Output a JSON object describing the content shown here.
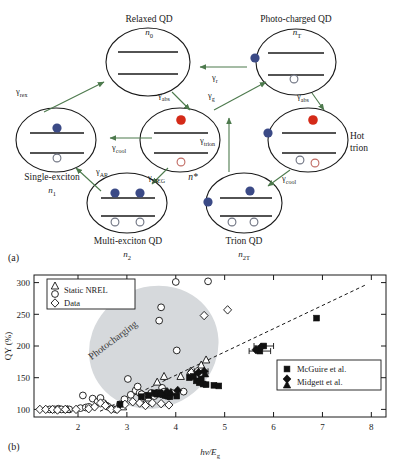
{
  "figure": {
    "panel_a": {
      "tag": "(a)",
      "title_note": "Quantum dot multiexciton / photocharging state diagram",
      "states": [
        {
          "id": "relaxed",
          "name": "Relaxed QD",
          "symbol": "n",
          "sub": "0",
          "cx": 148,
          "cy": 62,
          "rx": 42,
          "ry": 34
        },
        {
          "id": "photocharged",
          "name": "Photo-charged QD",
          "symbol": "n",
          "sub": "T",
          "cx": 296,
          "cy": 62,
          "rx": 40,
          "ry": 33
        },
        {
          "id": "single",
          "name": "Single-exciton",
          "symbol": "n",
          "sub": "1",
          "cx": 56,
          "cy": 140,
          "rx": 40,
          "ry": 32
        },
        {
          "id": "nstar",
          "name": "",
          "symbol": "n",
          "sub": "*",
          "cx": 180,
          "cy": 140,
          "rx": 40,
          "ry": 32
        },
        {
          "id": "hottrion",
          "name": "Hot trion",
          "symbol": "",
          "sub": "",
          "cx": 308,
          "cy": 140,
          "rx": 40,
          "ry": 32
        },
        {
          "id": "multi",
          "name": "Multi-exciton QD",
          "symbol": "n",
          "sub": "2",
          "cx": 127,
          "cy": 203,
          "rx": 40,
          "ry": 30
        },
        {
          "id": "trion",
          "name": "Trion QD",
          "symbol": "n",
          "sub": "2T",
          "cx": 244,
          "cy": 203,
          "rx": 38,
          "ry": 30
        }
      ],
      "state_labels": [
        {
          "key": "relaxed-title",
          "text": "Relaxed QD"
        },
        {
          "key": "relaxed-n",
          "text": "n"
        },
        {
          "key": "photocharged-title",
          "text": "Photo-charged QD"
        },
        {
          "key": "photocharged-n",
          "text": "n"
        },
        {
          "key": "single-title",
          "text": "Single-exciton"
        },
        {
          "key": "single-n",
          "text": "n"
        },
        {
          "key": "nstar-n",
          "text": "n*"
        },
        {
          "key": "hottrion-title-1",
          "text": "Hot"
        },
        {
          "key": "hottrion-title-2",
          "text": "trion"
        },
        {
          "key": "multi-title",
          "text": "Multi-exciton QD"
        },
        {
          "key": "multi-n",
          "text": "n"
        },
        {
          "key": "trion-title",
          "text": "Trion QD"
        },
        {
          "key": "trion-n",
          "text": "n"
        }
      ],
      "subscripts": {
        "relaxed": "0",
        "photocharged": "T",
        "single": "1",
        "multi": "2",
        "trion": "2T"
      },
      "rates": [
        {
          "id": "rex",
          "gamma": "γ",
          "sub": "rex",
          "x": 18,
          "y": 92
        },
        {
          "id": "abs1",
          "gamma": "γ",
          "sub": "abs",
          "x": 160,
          "y": 96
        },
        {
          "id": "r",
          "gamma": "γ",
          "sub": "r",
          "x": 196,
          "y": 79
        },
        {
          "id": "g",
          "gamma": "γ",
          "sub": "g",
          "x": 213,
          "y": 93
        },
        {
          "id": "abs2",
          "gamma": "γ",
          "sub": "abs",
          "x": 300,
          "y": 96
        },
        {
          "id": "cool1",
          "gamma": "γ",
          "sub": "cool",
          "x": 116,
          "y": 146
        },
        {
          "id": "trion",
          "gamma": "γ",
          "sub": "trion",
          "x": 212,
          "y": 140
        },
        {
          "id": "ar",
          "gamma": "γ",
          "sub": "AR",
          "x": 98,
          "y": 171
        },
        {
          "id": "meg",
          "gamma": "γ",
          "sub": "MEG",
          "x": 152,
          "y": 176
        },
        {
          "id": "cool2",
          "gamma": "γ",
          "sub": "cool",
          "x": 287,
          "y": 176
        }
      ],
      "colors": {
        "electron": "#3b4a86",
        "hot_electron": "#d42a18",
        "hole_outline": "#6d7280",
        "hot_hole_outline": "#c06a62",
        "arrow": "#4d7a4d",
        "qd_outline": "#1a1a1a"
      }
    },
    "panel_b": {
      "tag": "(b)"
    }
  },
  "chart_data": {
    "type": "scatter",
    "title": "",
    "xlabel": "hν/E",
    "xlabel_sub": "g",
    "ylabel": "QY (%)",
    "xlim": [
      1.1,
      8.3
    ],
    "ylim": [
      88,
      312
    ],
    "xticks": [
      2,
      3,
      4,
      5,
      6,
      7,
      8
    ],
    "yticks": [
      100,
      150,
      200,
      250,
      300
    ],
    "grid": false,
    "annotations": [
      {
        "text": "Photocharging",
        "x": 2.75,
        "y": 205,
        "rotation": -37
      }
    ],
    "shaded_region": {
      "label": "Photocharging",
      "type": "ellipse",
      "cx": 3.55,
      "cy": 198,
      "rx": 1.35,
      "ry": 95,
      "rotation": -28,
      "color": "#d6d9dc"
    },
    "trendline": {
      "type": "dashed",
      "x": [
        2.45,
        7.9
      ],
      "y": [
        97,
        297
      ]
    },
    "legends": [
      {
        "id": "left-legend",
        "position": "top-left",
        "entries": [
          {
            "marker": "triangle-open",
            "label": "Static NREL"
          },
          {
            "marker": "circle-open",
            "label": "Static NREL"
          },
          {
            "marker": "diamond-open",
            "label": "Data"
          }
        ],
        "lines": [
          "Static NREL",
          "Data"
        ]
      },
      {
        "id": "right-legend",
        "position": "mid-right",
        "entries": [
          {
            "marker": "square-filled",
            "label": "McGuire et al."
          },
          {
            "marker": "diamond-filled",
            "label": "Midgett et al."
          },
          {
            "marker": "triangle-filled",
            "label": "Midgett et al."
          }
        ],
        "lines": [
          "McGuire et al.",
          "Midgett et al."
        ]
      }
    ],
    "series": [
      {
        "name": "Static NREL (circles)",
        "marker": "circle-open",
        "points": [
          [
            1.42,
            100
          ],
          [
            1.52,
            100
          ],
          [
            1.6,
            101
          ],
          [
            1.66,
            100
          ],
          [
            1.82,
            100
          ],
          [
            2.05,
            102
          ],
          [
            2.1,
            122
          ],
          [
            2.16,
            103
          ],
          [
            2.22,
            104
          ],
          [
            2.3,
            117
          ],
          [
            2.4,
            112
          ],
          [
            2.46,
            118
          ],
          [
            2.52,
            110
          ],
          [
            2.58,
            106
          ],
          [
            2.62,
            104
          ],
          [
            2.7,
            101
          ],
          [
            2.78,
            100
          ],
          [
            2.86,
            108
          ],
          [
            2.95,
            116
          ],
          [
            3.02,
            148
          ],
          [
            3.08,
            123
          ],
          [
            3.18,
            130
          ],
          [
            3.22,
            136
          ],
          [
            3.26,
            126
          ],
          [
            3.3,
            124
          ],
          [
            3.38,
            120
          ],
          [
            3.44,
            122
          ],
          [
            3.5,
            126
          ],
          [
            3.56,
            121
          ],
          [
            3.62,
            126
          ],
          [
            3.66,
            240
          ],
          [
            3.7,
            261
          ],
          [
            3.72,
            134
          ],
          [
            3.76,
            128
          ],
          [
            3.8,
            122
          ],
          [
            3.86,
            121
          ],
          [
            3.92,
            126
          ],
          [
            4.0,
            301
          ],
          [
            4.02,
            193
          ],
          [
            4.16,
            128
          ],
          [
            4.52,
            163
          ],
          [
            4.66,
            302
          ]
        ]
      },
      {
        "name": "Static NREL (triangles)",
        "marker": "triangle-open",
        "points": [
          [
            1.78,
            100
          ],
          [
            2.92,
            104
          ],
          [
            3.3,
            112
          ],
          [
            3.44,
            118
          ],
          [
            3.62,
            143
          ],
          [
            3.76,
            152
          ],
          [
            4.1,
            152
          ],
          [
            4.3,
            160
          ],
          [
            4.52,
            170
          ],
          [
            4.62,
            178
          ]
        ]
      },
      {
        "name": "Data (diamonds)",
        "marker": "diamond-open",
        "points": [
          [
            1.22,
            100
          ],
          [
            1.34,
            100
          ],
          [
            1.48,
            100
          ],
          [
            1.58,
            99
          ],
          [
            1.74,
            100
          ],
          [
            1.96,
            100
          ],
          [
            2.22,
            101
          ],
          [
            2.34,
            104
          ],
          [
            2.46,
            110
          ],
          [
            2.56,
            106
          ],
          [
            2.68,
            100
          ],
          [
            2.8,
            100
          ],
          [
            2.96,
            108
          ],
          [
            3.12,
            112
          ],
          [
            3.26,
            110
          ],
          [
            3.38,
            106
          ],
          [
            3.52,
            110
          ],
          [
            3.7,
            109
          ],
          [
            3.86,
            107
          ],
          [
            4.32,
            158
          ],
          [
            4.44,
            160
          ],
          [
            4.58,
            248
          ],
          [
            5.06,
            257
          ]
        ]
      },
      {
        "name": "McGuire et al.",
        "marker": "square-filled",
        "points": [
          [
            2.86,
            108
          ],
          [
            3.3,
            120
          ],
          [
            3.44,
            122
          ],
          [
            3.56,
            126
          ],
          [
            3.62,
            124
          ],
          [
            3.68,
            126
          ],
          [
            3.74,
            123
          ],
          [
            3.78,
            122
          ],
          [
            3.84,
            121
          ],
          [
            3.88,
            120
          ],
          [
            4.02,
            121
          ],
          [
            4.28,
            150
          ],
          [
            4.36,
            152
          ],
          [
            4.42,
            145
          ],
          [
            4.48,
            142
          ],
          [
            4.52,
            148
          ],
          [
            4.56,
            140
          ],
          [
            4.62,
            139
          ],
          [
            4.78,
            138
          ],
          [
            4.88,
            137
          ],
          [
            5.72,
            192
          ],
          [
            5.8,
            200
          ],
          [
            6.88,
            244
          ]
        ]
      },
      {
        "name": "Midgett et al. (diamonds)",
        "marker": "diamond-filled",
        "points": [
          [
            3.82,
            128
          ],
          [
            4.04,
            130
          ],
          [
            4.46,
            158
          ],
          [
            4.58,
            160
          ],
          [
            5.64,
            194
          ],
          [
            5.74,
            198
          ]
        ]
      },
      {
        "name": "Midgett et al. (triangles)",
        "marker": "triangle-filled",
        "points": [
          [
            3.6,
            125
          ],
          [
            3.7,
            126
          ],
          [
            3.9,
            127
          ],
          [
            4.6,
            156
          ]
        ]
      }
    ],
    "errorbars": [
      {
        "x": 5.72,
        "y": 192,
        "xerr": 0.22,
        "yerr": 0
      },
      {
        "x": 5.8,
        "y": 200,
        "xerr": 0.2,
        "yerr": 0
      },
      {
        "x": 4.52,
        "y": 160,
        "xerr": 0.14,
        "yerr": 0
      }
    ]
  }
}
